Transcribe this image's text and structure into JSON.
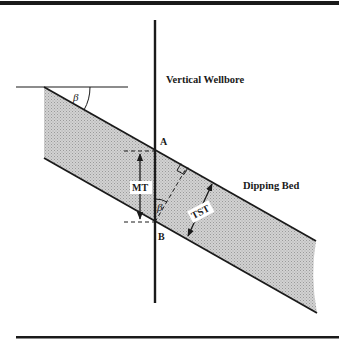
{
  "diagram": {
    "labels": {
      "wellbore": "Vertical Wellbore",
      "bed": "Dipping Bed",
      "point_a": "A",
      "point_b": "B",
      "mt": "MT",
      "tst": "TST",
      "dip_angle_top": "β",
      "dip_angle_well": "β"
    },
    "colors": {
      "line": "#1a1a1a",
      "bed_fill": "#c8c8c8",
      "background": "#ffffff"
    }
  }
}
